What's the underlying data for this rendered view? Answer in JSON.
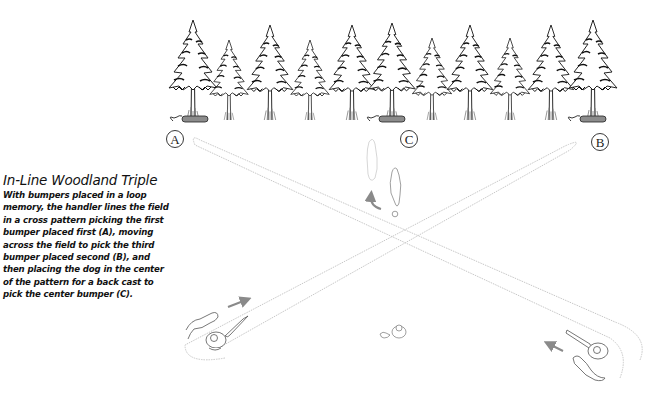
{
  "caption": {
    "title": "In-Line Woodland Triple",
    "body": "With bumpers placed in a loop memory, the handler lines the field in a cross pattern picking the first bumper placed first (A), moving across the field to pick the third bumper placed second (B), and then placing the dog in the center of the pattern for a back cast to pick the center bumper (C)."
  },
  "markers": [
    {
      "id": "A",
      "label": "A",
      "x": 175,
      "y": 139
    },
    {
      "id": "C",
      "label": "C",
      "x": 409,
      "y": 139
    },
    {
      "id": "B",
      "label": "B",
      "x": 600,
      "y": 142
    }
  ],
  "colors": {
    "path": "#c8c8c8",
    "ink": "#222222",
    "arrow": "#8a8a8a",
    "bumper": "#8c8c8c"
  },
  "trees": [
    {
      "x": 193,
      "h": 100
    },
    {
      "x": 229,
      "h": 80
    },
    {
      "x": 270,
      "h": 95
    },
    {
      "x": 310,
      "h": 80
    },
    {
      "x": 352,
      "h": 95
    },
    {
      "x": 392,
      "h": 97
    },
    {
      "x": 432,
      "h": 82
    },
    {
      "x": 470,
      "h": 95
    },
    {
      "x": 510,
      "h": 82
    },
    {
      "x": 551,
      "h": 95
    },
    {
      "x": 593,
      "h": 100
    }
  ]
}
